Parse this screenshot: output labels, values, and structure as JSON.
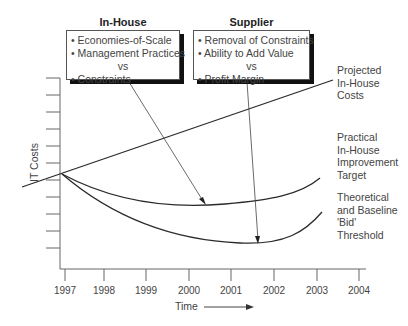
{
  "diagram": {
    "in_house": {
      "title": "In-House",
      "items": [
        "• Economies-of-Scale",
        "• Management Practices",
        "vs",
        "• Constraints"
      ]
    },
    "supplier": {
      "title": "Supplier",
      "items": [
        "• Removal of Constraints",
        "• Ability to Add Value",
        "vs",
        "• Profit Margin"
      ]
    },
    "curve_labels": {
      "projected": "Projected\nIn-House\nCosts",
      "practical": "Practical\nIn-House\nImprovement\nTarget",
      "theoretical": "Theoretical\nand Baseline\n'Bid'\nThreshold"
    },
    "axes": {
      "ylabel": "IT Costs",
      "xlabel": "Time",
      "x_ticks": [
        "1997",
        "1998",
        "1999",
        "2000",
        "2001",
        "2002",
        "2003",
        "2004"
      ]
    },
    "colors": {
      "line": "#2a2a2a",
      "axis": "#555555",
      "text": "#444444"
    }
  }
}
